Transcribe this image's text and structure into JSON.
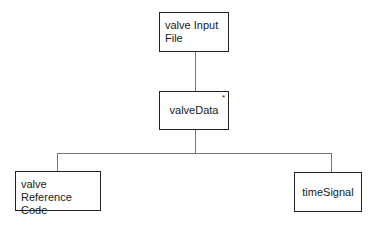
{
  "diagram": {
    "type": "hierarchy",
    "nodes": [
      {
        "id": "input",
        "label_line1": "valve Input",
        "label_line2": "File"
      },
      {
        "id": "data",
        "label": "valveData",
        "marker": "*"
      },
      {
        "id": "ref",
        "label_line1": "valve Reference",
        "label_line2": "Code"
      },
      {
        "id": "signal",
        "label": "timeSignal"
      }
    ],
    "edges": [
      {
        "from": "input",
        "to": "data"
      },
      {
        "from": "data",
        "to": "ref"
      },
      {
        "from": "data",
        "to": "signal"
      }
    ]
  }
}
